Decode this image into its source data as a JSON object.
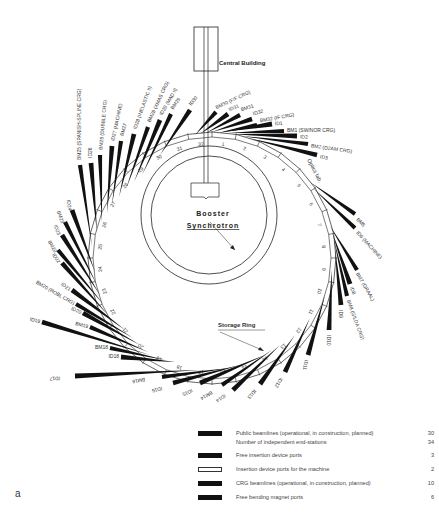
{
  "labels": {
    "central_building": "Central Building",
    "booster_line1": "Booster",
    "booster_line2": "Synchrotron",
    "storage_ring": "Storage Ring",
    "optics_lab": "Optics lab.",
    "figure_letter": "a"
  },
  "ring": {
    "cx": 212,
    "cy": 258,
    "rx": 124,
    "ry": 126,
    "cells": 32
  },
  "cell_numbers": [
    "1",
    "2",
    "3",
    "4",
    "5",
    "6",
    "7",
    "8",
    "9",
    "10",
    "11",
    "12",
    "13",
    "14",
    "15",
    "16",
    "17",
    "18",
    "19",
    "20",
    "21",
    "22",
    "23",
    "24",
    "25",
    "26",
    "27",
    "28",
    "29",
    "30",
    "31",
    "32"
  ],
  "beamlines": [
    {
      "name": "BM25 (SPANISH-SPLINE CRG)",
      "type": "crg",
      "sx": 92,
      "sy": 246,
      "ex": 80,
      "ey": 165,
      "lx": 80,
      "ly": 160,
      "rot": -90
    },
    {
      "name": "ID26",
      "type": "public",
      "sx": 97,
      "sy": 232,
      "ex": 91,
      "ey": 163,
      "lx": 91,
      "ly": 158,
      "rot": -90
    },
    {
      "name": "BM26 (DUBBLE CRG)",
      "type": "crg",
      "sx": 102,
      "sy": 222,
      "ex": 100,
      "ey": 155,
      "lx": 101,
      "ly": 150,
      "rot": -85
    },
    {
      "name": "ID27 (MACHINE)",
      "type": "public",
      "sx": 107,
      "sy": 213,
      "ex": 112,
      "ey": 146,
      "lx": 113,
      "ly": 141,
      "rot": -78
    },
    {
      "name": "BM27",
      "type": "free-bm",
      "sx": 112,
      "sy": 205,
      "ex": 121,
      "ey": 141,
      "lx": 122,
      "ly": 136,
      "rot": -75
    },
    {
      "name": "ID28 (INELASTIC II)",
      "type": "public",
      "sx": 119,
      "sy": 197,
      "ex": 134,
      "ey": 134,
      "lx": 135,
      "ly": 129,
      "rot": -70
    },
    {
      "name": "BM28 (XMAS CRG)",
      "type": "crg",
      "sx": 126,
      "sy": 189,
      "ex": 148,
      "ey": 127,
      "lx": 149,
      "ly": 122,
      "rot": -65
    },
    {
      "name": "ID29 (MAD II)",
      "type": "public",
      "sx": 134,
      "sy": 182,
      "ex": 160,
      "ey": 120,
      "lx": 161,
      "ly": 115,
      "rot": -60
    },
    {
      "name": "BM29",
      "type": "public",
      "sx": 142,
      "sy": 175,
      "ex": 171,
      "ey": 114,
      "lx": 172,
      "ly": 109,
      "rot": -55
    },
    {
      "name": "ID30",
      "type": "public",
      "sx": 160,
      "sy": 155,
      "ex": 190,
      "ey": 110,
      "lx": 190,
      "ly": 105,
      "rot": -50
    },
    {
      "name": "BM30 (F/F CRG)",
      "type": "crg",
      "sx": 195,
      "sy": 135,
      "ex": 216,
      "ey": 112,
      "lx": 216,
      "ly": 108,
      "rot": -25
    },
    {
      "name": "ID31",
      "type": "public",
      "sx": 200,
      "sy": 134,
      "ex": 228,
      "ey": 114,
      "lx": 229,
      "ly": 110,
      "rot": -22
    },
    {
      "name": "BM31",
      "type": "public",
      "sx": 206,
      "sy": 133,
      "ex": 240,
      "ey": 115,
      "lx": 241,
      "ly": 110,
      "rot": -18
    },
    {
      "name": "ID32",
      "type": "public",
      "sx": 212,
      "sy": 132,
      "ex": 252,
      "ey": 119,
      "lx": 253,
      "ly": 114,
      "rot": -15
    },
    {
      "name": "BM32 (IF CRG)",
      "type": "crg",
      "sx": 218,
      "sy": 133,
      "ex": 257,
      "ey": 125,
      "lx": 260,
      "ly": 121,
      "rot": -10
    },
    {
      "name": "ID1",
      "type": "public",
      "sx": 222,
      "sy": 132,
      "ex": 272,
      "ey": 124,
      "lx": 275,
      "ly": 124,
      "rot": -5
    },
    {
      "name": "BM1 (SW/NOR CRG)",
      "type": "crg",
      "sx": 228,
      "sy": 133,
      "ex": 284,
      "ey": 131,
      "lx": 287,
      "ly": 131,
      "rot": 0
    },
    {
      "name": "ID2",
      "type": "public",
      "sx": 232,
      "sy": 134,
      "ex": 297,
      "ey": 136,
      "lx": 300,
      "ly": 137,
      "rot": 3
    },
    {
      "name": "BM2 (D2AM CRG)",
      "type": "crg",
      "sx": 242,
      "sy": 136,
      "ex": 308,
      "ey": 144,
      "lx": 311,
      "ly": 146,
      "rot": 8
    },
    {
      "name": "ID3",
      "type": "public",
      "sx": 248,
      "sy": 138,
      "ex": 317,
      "ey": 155,
      "lx": 320,
      "ly": 157,
      "rot": 10
    },
    {
      "name": "BM5",
      "type": "public",
      "sx": 310,
      "sy": 182,
      "ex": 355,
      "ey": 214,
      "lx": 357,
      "ly": 219,
      "rot": 45
    },
    {
      "name": "ID6 (MACHINE)",
      "type": "machine",
      "sx": 313,
      "sy": 188,
      "ex": 355,
      "ey": 228,
      "lx": 357,
      "ly": 232,
      "rot": 48
    },
    {
      "name": "BM7 (GRAAL)",
      "type": "crg",
      "sx": 330,
      "sy": 226,
      "ex": 357,
      "ey": 270,
      "lx": 357,
      "ly": 273,
      "rot": 60
    },
    {
      "name": "ID8",
      "type": "public",
      "sx": 332,
      "sy": 232,
      "ex": 350,
      "ey": 284,
      "lx": 351,
      "ly": 287,
      "rot": 68
    },
    {
      "name": "BM8 (GILDA CRG)",
      "type": "crg",
      "sx": 334,
      "sy": 240,
      "ex": 347,
      "ey": 296,
      "lx": 348,
      "ly": 300,
      "rot": 70
    },
    {
      "name": "ID9",
      "type": "public",
      "sx": 335,
      "sy": 250,
      "ex": 341,
      "ey": 305,
      "lx": 340,
      "ly": 310,
      "rot": 90
    },
    {
      "name": "ID10",
      "type": "public",
      "sx": 332,
      "sy": 270,
      "ex": 329,
      "ey": 330,
      "lx": 328,
      "ly": 335,
      "rot": 90
    },
    {
      "name": "ID11",
      "type": "public",
      "sx": 325,
      "sy": 295,
      "ex": 308,
      "ey": 355,
      "lx": 306,
      "ly": 360,
      "rot": 100
    },
    {
      "name": "ID12",
      "type": "public",
      "sx": 310,
      "sy": 318,
      "ex": 285,
      "ey": 372,
      "lx": 281,
      "ly": 378,
      "rot": 120
    },
    {
      "name": "ID13",
      "type": "public",
      "sx": 295,
      "sy": 335,
      "ex": 260,
      "ey": 384,
      "lx": 255,
      "ly": 390,
      "rot": 130
    },
    {
      "name": "ID14",
      "type": "public",
      "sx": 280,
      "sy": 345,
      "ex": 233,
      "ey": 390,
      "lx": 225,
      "ly": 395,
      "rot": 145
    },
    {
      "name": "BM14",
      "type": "crg",
      "sx": 272,
      "sy": 350,
      "ex": 222,
      "ey": 385,
      "lx": 212,
      "ly": 392,
      "rot": 150
    },
    {
      "name": "ID15",
      "type": "public",
      "sx": 265,
      "sy": 355,
      "ex": 200,
      "ey": 383,
      "lx": 192,
      "ly": 390,
      "rot": 155
    },
    {
      "name": "ID16",
      "type": "public",
      "sx": 240,
      "sy": 365,
      "ex": 173,
      "ey": 383,
      "lx": 162,
      "ly": 388,
      "rot": 165
    },
    {
      "name": "BM16",
      "type": "free-bm",
      "sx": 230,
      "sy": 368,
      "ex": 162,
      "ey": 377,
      "lx": 145,
      "ly": 379,
      "rot": 170
    },
    {
      "name": "ID17",
      "type": "public",
      "sx": 200,
      "sy": 370,
      "ex": 75,
      "ey": 376,
      "lx": 60,
      "ly": 378,
      "rot": 178
    },
    {
      "name": "ID18",
      "type": "public",
      "sx": 175,
      "sy": 362,
      "ex": 121,
      "ey": 357,
      "lx": 108,
      "ly": 359,
      "rot": 0
    },
    {
      "name": "BM18",
      "type": "free-bm",
      "sx": 165,
      "sy": 360,
      "ex": 110,
      "ey": 348,
      "lx": 92,
      "ly": 348,
      "rot": 0
    },
    {
      "name": "BM19",
      "type": "free-bm",
      "sx": 148,
      "sy": 352,
      "ex": 90,
      "ey": 327,
      "lx": 73,
      "ly": 324,
      "rot": 15
    },
    {
      "name": "ID19",
      "type": "public",
      "sx": 150,
      "sy": 355,
      "ex": 42,
      "ey": 322,
      "lx": 28,
      "ly": 317,
      "rot": 15
    },
    {
      "name": "ID20",
      "type": "public",
      "sx": 140,
      "sy": 345,
      "ex": 83,
      "ey": 313,
      "lx": 68,
      "ly": 309,
      "rot": 25
    },
    {
      "name": "BM20 (ROBL CRG)",
      "type": "crg",
      "sx": 133,
      "sy": 338,
      "ex": 76,
      "ey": 304,
      "lx": 22,
      "ly": 282,
      "rot": 30
    },
    {
      "name": "ID21",
      "type": "public",
      "sx": 125,
      "sy": 330,
      "ex": 72,
      "ey": 290,
      "lx": 62,
      "ly": 285,
      "rot": 35
    },
    {
      "name": "ID22",
      "type": "public",
      "sx": 108,
      "sy": 315,
      "ex": 62,
      "ey": 263,
      "lx": 53,
      "ly": 254,
      "rot": 55
    },
    {
      "name": "BM22",
      "type": "free-bm",
      "sx": 104,
      "sy": 305,
      "ex": 58,
      "ey": 250,
      "lx": 49,
      "ly": 241,
      "rot": 60
    },
    {
      "name": "ID23",
      "type": "public",
      "sx": 100,
      "sy": 295,
      "ex": 62,
      "ey": 235,
      "lx": 55,
      "ly": 225,
      "rot": 70
    },
    {
      "name": "BM23",
      "type": "public",
      "sx": 97,
      "sy": 285,
      "ex": 65,
      "ey": 222,
      "lx": 58,
      "ly": 211,
      "rot": 70
    },
    {
      "name": "ID24",
      "type": "public",
      "sx": 95,
      "sy": 272,
      "ex": 72,
      "ey": 210,
      "lx": 68,
      "ly": 200,
      "rot": 80
    }
  ],
  "legend": [
    {
      "label": "Public beamlines (operational, in construction, planned)",
      "count": "30",
      "swatch": "black"
    },
    {
      "label": "Number of independent end-stations",
      "count": "34",
      "swatch": "none"
    },
    {
      "label": "Free insertion device ports",
      "count": "3",
      "swatch": "black"
    },
    {
      "label": "Insertion device ports for the machine",
      "count": "2",
      "swatch": "white"
    },
    {
      "label": "CRG beamlines (operational, in construction, planned)",
      "count": "10",
      "swatch": "black"
    },
    {
      "label": "Free bending magnet ports",
      "count": "6",
      "swatch": "black"
    }
  ]
}
